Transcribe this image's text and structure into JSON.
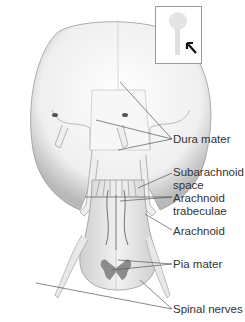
{
  "diagram": {
    "labels": [
      {
        "id": "dura-mater",
        "text": "Dura mater"
      },
      {
        "id": "subarachnoid-space",
        "text": "Subarachnoid space",
        "lines": [
          "Subarachnoid",
          "space"
        ]
      },
      {
        "id": "arachnoid-trabeculae",
        "text": "Arachnoid trabeculae",
        "lines": [
          "Arachnoid",
          "trabeculae"
        ]
      },
      {
        "id": "arachnoid",
        "text": "Arachnoid"
      },
      {
        "id": "pia-mater",
        "text": "Pia mater"
      },
      {
        "id": "spinal-nerves",
        "text": "Spinal nerves"
      }
    ],
    "inset": {
      "description": "Locator thumbnail of body with arrow pointing to spinal region"
    },
    "colors": {
      "line": "#555555",
      "text": "#333333",
      "tissue": "#d8d8d8",
      "shadow": "#9a9a9a",
      "gray_matter": "#8c8c8c"
    }
  }
}
